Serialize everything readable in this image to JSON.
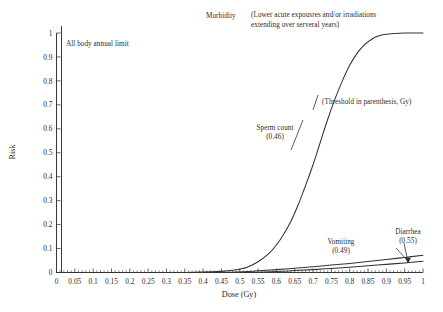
{
  "chart_data": {
    "type": "line",
    "title": "",
    "xlabel": "Dose (Gy)",
    "ylabel": "Risk",
    "xlim": [
      0,
      1
    ],
    "ylim": [
      0,
      1
    ],
    "grid": false,
    "legend_position": "inline-annotations",
    "x_ticks": [
      "0",
      "0.05",
      "0.1",
      "0.15",
      "0.2",
      "0.25",
      "0.3",
      "0.35",
      "0.4",
      "0.45",
      "0.5",
      "0.55",
      "0.6",
      "0.65",
      "0.7",
      "0.75",
      "0.8",
      "0.85",
      "0.9",
      "0.95",
      "1"
    ],
    "y_ticks": [
      "0",
      "0.1",
      "0.2",
      "0.3",
      "0.4",
      "0.5",
      "0.6",
      "0.7",
      "0.8",
      "0.9",
      "1"
    ],
    "series": [
      {
        "name": "Sperm count",
        "threshold": "0.46",
        "label": "Sperm count",
        "sublabel": "(0.46)",
        "x": [
          0,
          0.05,
          0.1,
          0.15,
          0.2,
          0.25,
          0.3,
          0.35,
          0.4,
          0.44,
          0.46,
          0.48,
          0.5,
          0.52,
          0.55,
          0.58,
          0.6,
          0.62,
          0.64,
          0.66,
          0.68,
          0.7,
          0.72,
          0.74,
          0.76,
          0.78,
          0.8,
          0.82,
          0.84,
          0.86,
          0.88,
          0.9,
          0.95,
          1
        ],
        "y": [
          0,
          0,
          0,
          0,
          0,
          0,
          0,
          0,
          0.002,
          0.004,
          0.006,
          0.009,
          0.014,
          0.022,
          0.045,
          0.08,
          0.115,
          0.16,
          0.215,
          0.285,
          0.365,
          0.45,
          0.545,
          0.64,
          0.725,
          0.8,
          0.865,
          0.915,
          0.95,
          0.974,
          0.988,
          0.995,
          1.0,
          1.0
        ]
      },
      {
        "name": "Vomiting",
        "threshold": "0.49",
        "label": "Vomiting",
        "sublabel": "(0.49)",
        "x": [
          0,
          0.1,
          0.2,
          0.3,
          0.4,
          0.49,
          0.55,
          0.6,
          0.65,
          0.7,
          0.75,
          0.8,
          0.85,
          0.9,
          0.95,
          1
        ],
        "y": [
          0,
          0,
          0,
          0,
          0,
          0.002,
          0.007,
          0.012,
          0.018,
          0.024,
          0.031,
          0.038,
          0.046,
          0.054,
          0.063,
          0.072
        ]
      },
      {
        "name": "Diarrhea",
        "threshold": "0.55",
        "label": "Diarrhea",
        "sublabel": "(0.55)",
        "x": [
          0,
          0.1,
          0.2,
          0.3,
          0.4,
          0.5,
          0.55,
          0.6,
          0.65,
          0.7,
          0.75,
          0.8,
          0.85,
          0.9,
          0.95,
          1
        ],
        "y": [
          0,
          0,
          0,
          0,
          0,
          0,
          0.001,
          0.004,
          0.008,
          0.012,
          0.017,
          0.022,
          0.028,
          0.034,
          0.04,
          0.047
        ]
      }
    ],
    "annotations": [
      {
        "id": "morbidity",
        "text": "Morbidity"
      },
      {
        "id": "exposure-note-line1",
        "text": "(Lower acute expousres and/or irradiations"
      },
      {
        "id": "exposure-note-line2",
        "text": "extending over serveral years)"
      },
      {
        "id": "annual-limit",
        "text": "All body annual limit"
      },
      {
        "id": "threshold-note",
        "text": "(Threshold in parenthesis, Gy)"
      }
    ],
    "colors": {
      "line": "#333333",
      "axis": "#3a3a3a",
      "text": "#2b2b2b",
      "background": "#ffffff"
    }
  }
}
